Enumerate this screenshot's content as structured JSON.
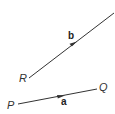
{
  "diagram": {
    "type": "vectors",
    "stroke_color": "#333333",
    "vectors": [
      {
        "name": "b",
        "label": "b",
        "start_point": "R",
        "start": [
          29,
          78
        ],
        "end": [
          114,
          13
        ],
        "arrow_at": [
          75,
          43
        ],
        "label_pos": [
          68,
          39
        ]
      },
      {
        "name": "a",
        "label": "a",
        "start_point": "P",
        "end_point": "Q",
        "start": [
          18,
          104
        ],
        "end": [
          97,
          89
        ],
        "arrow_at": [
          63,
          96
        ],
        "label_pos": [
          61,
          105
        ]
      }
    ],
    "points": [
      {
        "name": "R",
        "label": "R",
        "pos": [
          19,
          82
        ]
      },
      {
        "name": "P",
        "label": "P",
        "pos": [
          7,
          109
        ]
      },
      {
        "name": "Q",
        "label": "Q",
        "pos": [
          99,
          91
        ]
      }
    ]
  }
}
